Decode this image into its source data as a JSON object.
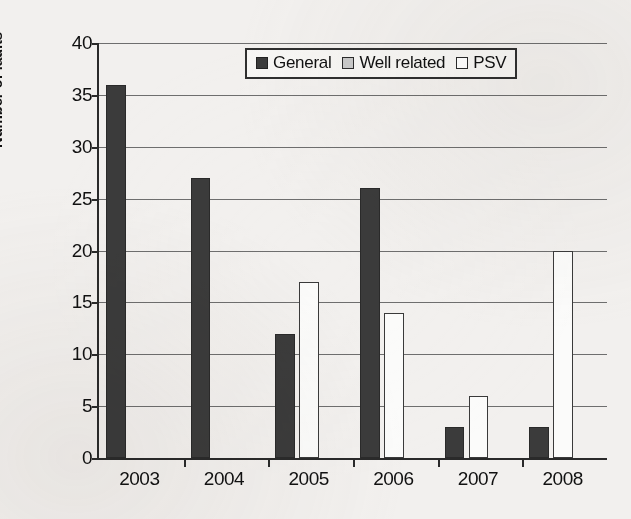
{
  "chart_data": {
    "type": "bar",
    "title": "",
    "xlabel": "",
    "ylabel": "Number of faults",
    "categories": [
      "2003",
      "2004",
      "2005",
      "2006",
      "2007",
      "2008"
    ],
    "series": [
      {
        "name": "General",
        "color": "#3b3b3b",
        "values": [
          36,
          27,
          12,
          26,
          3,
          3
        ]
      },
      {
        "name": "Well related",
        "color": "#c9c9c9",
        "values": [
          0,
          0,
          17,
          14,
          6,
          20
        ]
      },
      {
        "name": "PSV",
        "color": "#ffffff",
        "values": [
          0,
          0,
          0,
          0,
          0,
          0
        ]
      }
    ],
    "ylim": [
      0,
      40
    ],
    "yticks": [
      0,
      5,
      10,
      15,
      20,
      25,
      30,
      35,
      40
    ],
    "ytick_labels": [
      "0",
      "5",
      "10",
      "15",
      "20",
      "25",
      "30",
      "35",
      "40"
    ],
    "grid": true,
    "legend_position": "top-center",
    "legend_entries": [
      "General",
      "Well related",
      "PSV"
    ]
  }
}
